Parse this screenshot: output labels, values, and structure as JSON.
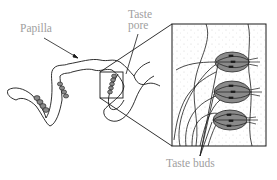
{
  "diagram": {
    "type": "scientific-illustration",
    "labels": {
      "papilla": "Papilla",
      "taste_pore_line1": "Taste",
      "taste_pore_line2": "pore",
      "taste_buds": "Taste buds"
    },
    "colors": {
      "line": "#1a1a1a",
      "label": "#a0a0a0",
      "bud_fill": "#8a8a8a",
      "background": "#ffffff"
    },
    "inset": {
      "description": "Magnified view of taste buds with nerve fibers",
      "bud_count": 3
    }
  }
}
